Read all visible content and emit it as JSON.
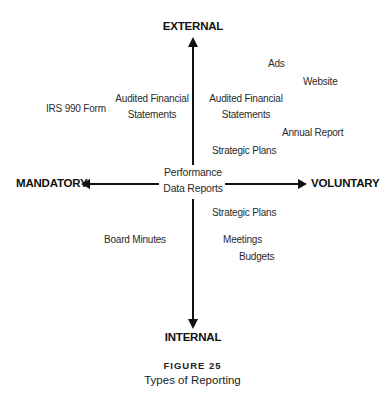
{
  "axes": {
    "top": "EXTERNAL",
    "bottom": "INTERNAL",
    "left": "MANDATORY",
    "right": "VOLUNTARY"
  },
  "center": {
    "line1": "Performance",
    "line2": "Data Reports"
  },
  "items": {
    "ads": "Ads",
    "website": "Website",
    "audited_right_1": "Audited Financial",
    "audited_right_2": "Statements",
    "annual_report": "Annual Report",
    "strategic_plans_upper": "Strategic Plans",
    "irs_990": "IRS 990 Form",
    "audited_left_1": "Audited Financial",
    "audited_left_2": "Statements",
    "strategic_plans_lower": "Strategic Plans",
    "board_minutes": "Board Minutes",
    "meetings": "Meetings",
    "budgets": "Budgets"
  },
  "caption": {
    "number": "FIGURE 25",
    "title": "Types of Reporting"
  },
  "colors": {
    "ink": "#111111",
    "text": "#2b2b2b",
    "background": "#ffffff"
  }
}
